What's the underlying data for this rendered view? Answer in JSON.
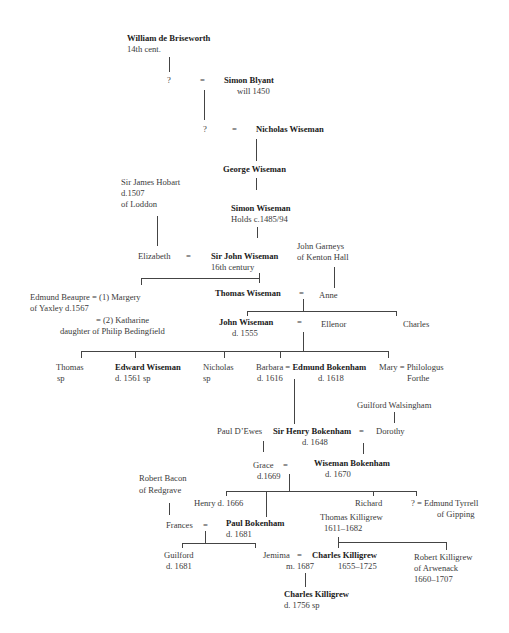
{
  "persons": {
    "william_de_briseworth": {
      "name": "William de Briseworth",
      "note": "14th cent."
    },
    "unknown_1": {
      "name": "?"
    },
    "simon_blyant": {
      "name": "Simon Blyant",
      "note": "will  1450"
    },
    "unknown_2": {
      "name": "?"
    },
    "nicholas_wiseman": {
      "name": "Nicholas Wiseman"
    },
    "george_wiseman": {
      "name": "George Wiseman"
    },
    "sir_james_hobart": {
      "name": "Sir James Hobart",
      "note1": "d.1507",
      "note2": "of Loddon"
    },
    "simon_wiseman": {
      "name": "Simon Wiseman",
      "note": "Holds c.1485/94"
    },
    "elizabeth": {
      "name": "Elizabeth"
    },
    "sir_john_wiseman": {
      "name": "Sir John Wiseman",
      "note": "16th century"
    },
    "john_garneys": {
      "name": "John Garneys",
      "note": "of Kenton Hall"
    },
    "edmund_beaupre": {
      "name": "Edmund Beaupre",
      "marriage1": "=  (1) Margery",
      "note": "of Yaxley  d.1567",
      "marriage2": "= (2) Katharine",
      "marriage2_note": "daughter of Philip Bedingfield"
    },
    "thomas_wiseman": {
      "name": "Thomas Wiseman"
    },
    "anne": {
      "name": "Anne"
    },
    "john_wiseman": {
      "name": "John Wiseman",
      "note": "d. 1555"
    },
    "ellenor": {
      "name": "Ellenor"
    },
    "charles": {
      "name": "Charles"
    },
    "thomas": {
      "name": "Thomas",
      "note": "sp"
    },
    "edward_wiseman": {
      "name": "Edward Wiseman",
      "note": "d. 1561    sp"
    },
    "nicholas": {
      "name": "Nicholas",
      "note": "sp"
    },
    "barbara": {
      "name": "Barbara",
      "note": "d. 1616"
    },
    "edmund_bokenham": {
      "name": "Edmund Bokenham",
      "note": "d. 1618"
    },
    "mary": {
      "name": "Mary"
    },
    "philologus_forthe": {
      "name": "Philologus",
      "note": "Forthe"
    },
    "guilford_walsingham": {
      "name": "Guilford Walsingham"
    },
    "paul_dewes": {
      "name": "Paul D’Ewes"
    },
    "sir_henry_bokenham": {
      "name": "Sir Henry Bokenham",
      "note": "d. 1648"
    },
    "dorothy": {
      "name": "Dorothy"
    },
    "grace": {
      "name": "Grace",
      "note": "d.1669"
    },
    "wiseman_bokenham": {
      "name": "Wiseman Bokenham",
      "note": "d. 1670"
    },
    "robert_bacon": {
      "name": "Robert Bacon",
      "note": "of Redgrave"
    },
    "henry": {
      "name": "Henry d. 1666"
    },
    "richard": {
      "name": "Richard"
    },
    "unknown_3": {
      "name": "?"
    },
    "edmund_tyrrell": {
      "name": "Edmund Tyrrell",
      "note": "of Gipping"
    },
    "frances": {
      "name": "Frances"
    },
    "paul_bokenham": {
      "name": "Paul  Bokenham",
      "note": "d. 1681"
    },
    "thomas_killigrew": {
      "name": "Thomas Killigrew",
      "note": "1611–1682"
    },
    "guilford": {
      "name": "Guilford",
      "note": "d. 1681"
    },
    "jemima": {
      "name": "Jemima",
      "note": "m. 1687"
    },
    "charles_killigrew_1": {
      "name": "Charles Killigrew",
      "note": "1655–1725"
    },
    "robert_killigrew": {
      "name": "Robert Killigrew",
      "note1": "of Arwenack",
      "note2": "1660–1707"
    },
    "charles_killigrew_2": {
      "name": "Charles Killigrew",
      "note": "d. 1756     sp"
    }
  },
  "symbols": {
    "equals": "="
  }
}
